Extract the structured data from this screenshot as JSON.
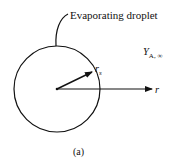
{
  "diagram": {
    "title_label": "Evaporating droplet",
    "far_field_label": {
      "main": "Y",
      "sub": "A, ∞"
    },
    "radius_label": {
      "main": "r",
      "sub": "s"
    },
    "axis_label": "r",
    "caption": "(a)",
    "colors": {
      "stroke": "#111111",
      "background": "#ffffff"
    },
    "elements": [
      {
        "type": "circle",
        "name": "droplet",
        "cx": 57,
        "cy": 89,
        "r": 43
      },
      {
        "type": "arrow",
        "name": "radius-arrow",
        "from": [
          57,
          89
        ],
        "to": [
          92,
          72
        ]
      },
      {
        "type": "arrow",
        "name": "radial-axis-arrow",
        "from": [
          57,
          89
        ],
        "to": [
          152,
          89
        ]
      },
      {
        "type": "leader",
        "name": "label-leader",
        "from": [
          56,
          46
        ],
        "to": [
          68,
          14
        ]
      }
    ]
  }
}
